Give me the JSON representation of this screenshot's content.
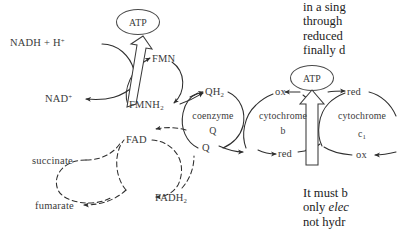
{
  "figure": {
    "name": "electron-transport-chain-diagram",
    "background_color": "#ffffff",
    "ink_color": "#2e2e2e"
  },
  "diagram": {
    "substrates": {
      "nadh": "NADH + H",
      "nadh_sup": "+",
      "nad": "NAD",
      "nad_sup": "+",
      "succinate": "succinate",
      "fumarate": "fumarate"
    },
    "carriers": [
      {
        "id": "fmn-complex",
        "oxidized_label": "FMN",
        "reduced_label": "FMNH",
        "reduced_sub": "2",
        "center_label": "",
        "center_sub": ""
      },
      {
        "id": "fad-complex",
        "oxidized_label": "FAD",
        "reduced_label": "FADH",
        "reduced_sub": "2",
        "center_label": "",
        "center_sub": ""
      },
      {
        "id": "coenzyme-q",
        "oxidized_label": "Q",
        "reduced_label": "QH",
        "reduced_sub": "2",
        "center_label": "coenzyme",
        "center_sub": "Q"
      },
      {
        "id": "cytochrome-b",
        "oxidized_label": "ox",
        "reduced_label": "red",
        "center_label": "cytochrome",
        "center_sub": "b"
      },
      {
        "id": "cytochrome-c1",
        "oxidized_label": "ox",
        "reduced_label": "red",
        "center_label": "cytochrome",
        "center_sub": "c",
        "center_sub_index": "1"
      }
    ],
    "atp_nodes": [
      {
        "id": "atp-left",
        "label": "ATP"
      },
      {
        "id": "atp-right",
        "label": "ATP"
      }
    ]
  },
  "text_top": {
    "lines": [
      "in a sing",
      "through",
      "reduced",
      "finally d"
    ]
  },
  "text_bottom": {
    "lines": [
      {
        "pre": "It must b",
        "em": "",
        "post": ""
      },
      {
        "pre": "only ",
        "em": "elec",
        "post": ""
      },
      {
        "pre": "not hydr",
        "em": "",
        "post": ""
      }
    ]
  }
}
